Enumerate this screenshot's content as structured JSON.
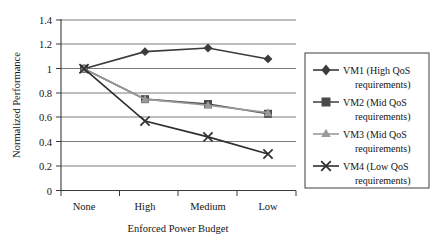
{
  "chart_data": {
    "type": "line",
    "title": "",
    "xlabel": "Enforced Power Budget",
    "ylabel": "Normalized Performance",
    "categories": [
      "None",
      "High",
      "Medium",
      "Low"
    ],
    "ylim": [
      0,
      1.4
    ],
    "yticks": [
      "0",
      "0.2",
      "0.4",
      "0.6",
      "0.8",
      "1",
      "1.2",
      "1.4"
    ],
    "ytick_values": [
      0,
      0.2,
      0.4,
      0.6,
      0.8,
      1.0,
      1.2,
      1.4
    ],
    "grid": "horizontal",
    "legend_position": "right",
    "series": [
      {
        "name": "VM1 (High QoS requirements)",
        "legend_line1": "VM1 (High QoS",
        "legend_line2": "requirements)",
        "marker": "diamond-marker",
        "color": "#3b3b3b",
        "values": [
          1.0,
          1.14,
          1.17,
          1.08
        ]
      },
      {
        "name": "VM2 (Mid QoS requirements)",
        "legend_line1": "VM2 (Mid QoS",
        "legend_line2": "requirements)",
        "marker": "square-marker",
        "color": "#4a4a4a",
        "values": [
          1.0,
          0.75,
          0.71,
          0.63
        ]
      },
      {
        "name": "VM3 (Mid QoS requirements)",
        "legend_line1": "VM3 (Mid QoS",
        "legend_line2": "requirements)",
        "marker": "triangle-marker",
        "color": "#9a9a9a",
        "values": [
          1.0,
          0.75,
          0.7,
          0.64
        ]
      },
      {
        "name": "VM4 (Low QoS requirements)",
        "legend_line1": "VM4 (Low QoS",
        "legend_line2": "requirements)",
        "marker": "cross-marker",
        "color": "#2e2e2e",
        "values": [
          1.0,
          0.57,
          0.44,
          0.3
        ]
      }
    ]
  },
  "axes": {
    "y_title": "Normalized Performance",
    "x_title": "Enforced Power Budget"
  },
  "colors": {
    "grid": "#7d7d7d",
    "axis": "#3a3a3a",
    "background": "#ffffff",
    "legend_border": "#3f3f3f"
  }
}
